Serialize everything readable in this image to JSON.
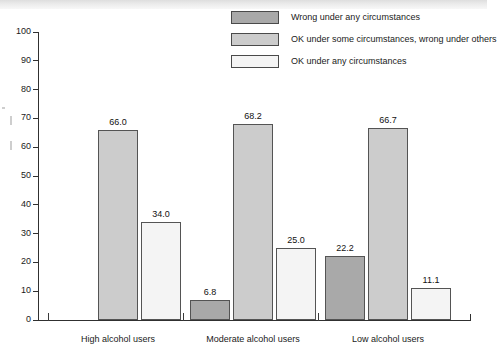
{
  "chart_data": {
    "type": "bar",
    "title": "",
    "subtitle": "",
    "xlabel": "",
    "ylabel": "",
    "ylim": [
      0,
      100
    ],
    "ytick_step": 10,
    "yticks": [
      "100",
      "90",
      "80",
      "70",
      "60",
      "50",
      "40",
      "30",
      "20",
      "10",
      "0"
    ],
    "grid": false,
    "legend_position": "top-right",
    "categories": [
      "High alcohol users",
      "Moderate alcohol users",
      "Low alcohol users"
    ],
    "series": [
      {
        "name": "Wrong under any circumstances",
        "color": "#a9a9a9",
        "values": [
          0.0,
          6.8,
          22.2
        ],
        "labels": [
          "",
          "6.8",
          "22.2"
        ]
      },
      {
        "name": "OK under some circumstances, wrong under others",
        "color": "#cccccc",
        "values": [
          66.0,
          68.2,
          66.7
        ],
        "labels": [
          "66.0",
          "68.2",
          "66.7"
        ]
      },
      {
        "name": "OK under any circumstances",
        "color": "#f4f4f4",
        "values": [
          34.0,
          25.0,
          11.1
        ],
        "labels": [
          "34.0",
          "25.0",
          "11.1"
        ]
      }
    ]
  },
  "legend": {
    "items": [
      {
        "label": "Wrong under any circumstances",
        "color": "#a9a9a9"
      },
      {
        "label": "OK under some circumstances, wrong under others",
        "color": "#cccccc"
      },
      {
        "label": "OK under any circumstances",
        "color": "#f4f4f4"
      }
    ]
  },
  "axis": {
    "y_labels": [
      "100",
      "90",
      "80",
      "70",
      "60",
      "50",
      "40",
      "30",
      "20",
      "10",
      "0"
    ],
    "x_labels": [
      "High alcohol users",
      "Moderate alcohol users",
      "Low alcohol users"
    ]
  }
}
